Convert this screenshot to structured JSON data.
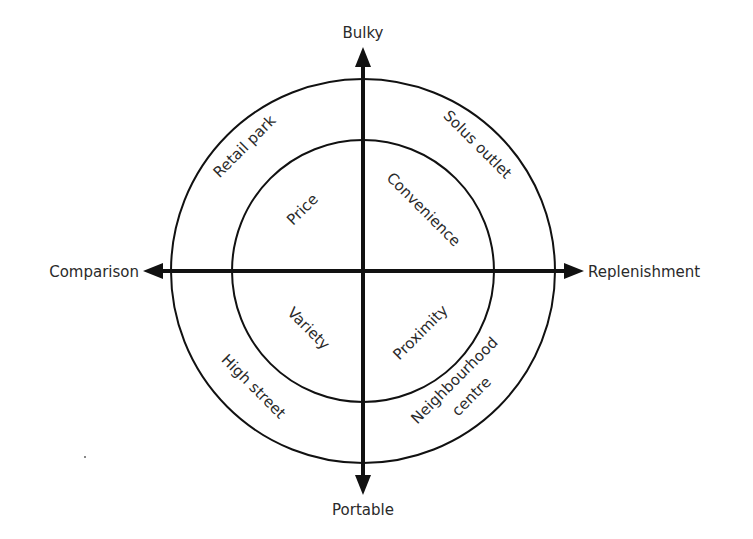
{
  "axes": {
    "top": "Bulky",
    "bottom": "Portable",
    "left": "Comparison",
    "right": "Replenishment"
  },
  "outer_ring": {
    "top_left": "Retail park",
    "top_right": "Solus outlet",
    "bottom_left": "High street",
    "bottom_right_line1": "Neighbourhood",
    "bottom_right_line2": "centre"
  },
  "inner_circle": {
    "top_left": "Price",
    "top_right": "Convenience",
    "bottom_left": "Variety",
    "bottom_right": "Proximity"
  },
  "colors": {
    "line": "#111111",
    "text": "#2a2a2a",
    "background": "#ffffff"
  }
}
